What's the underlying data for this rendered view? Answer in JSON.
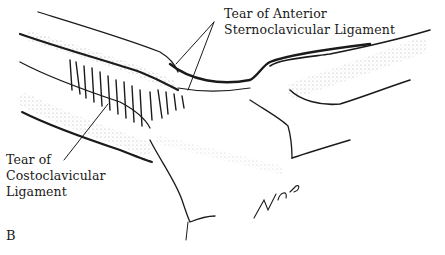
{
  "figure": {
    "panel_letter": "B",
    "labels": {
      "anterior": [
        "Tear of Anterior",
        "Sternoclavicular Ligament"
      ],
      "costo": [
        "Tear of",
        "Costoclavicular",
        "Ligament"
      ]
    },
    "signature": "R.G.B.",
    "colors": {
      "ink": "#1a1a1a",
      "background": "#ffffff"
    }
  }
}
